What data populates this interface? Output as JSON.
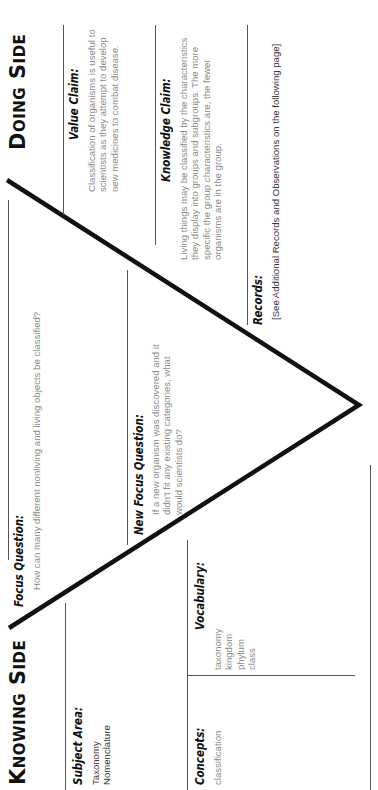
{
  "knowing_side": {
    "title": "Knowing Side",
    "subject_area": {
      "label": "Subject Area:",
      "items": [
        "Taxonomy",
        "Nomenclature"
      ]
    },
    "concepts": {
      "label": "Concepts:",
      "items": [
        "classification"
      ]
    },
    "vocabulary": {
      "label": "Vocabulary:",
      "items": [
        "taxonomy",
        "kingdom",
        "phylum",
        "class"
      ]
    }
  },
  "center": {
    "focus_question": {
      "label": "Focus Question:",
      "text": "How can many different nonliving and living objects be classified?"
    },
    "new_focus_question": {
      "label": "New Focus Question:",
      "text": "If a new organism was discovered and it didn't fit any existing categories, what would scientists do?"
    }
  },
  "doing_side": {
    "title": "Doing Side",
    "value_claim": {
      "label": "Value Claim:",
      "text": "Classification of organisms is useful to scientists as they attempt to develop new medicines to combat disease."
    },
    "knowledge_claim": {
      "label": "Knowledge Claim:",
      "text": "Living things may be classified by the characteristics they display into groups and subgroups.  The more specific the group characteristics are, the fewer organisms are in the group."
    },
    "records": {
      "label": "Records:",
      "text": "[See Additional Records and Observations on the following page]"
    }
  },
  "colors": {
    "ink": "#111111",
    "body_text": "#8a8a8a",
    "rule": "#555555"
  }
}
